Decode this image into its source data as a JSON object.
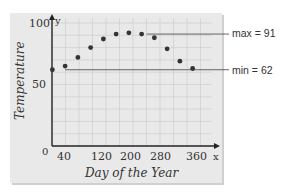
{
  "chart_data": {
    "type": "scatter",
    "title": "",
    "xlabel": "Day of the Year",
    "ylabel": "Temperature",
    "x_axis_letter": "x",
    "y_axis_letter": "y",
    "x_ticks": [
      "0",
      "40",
      "120",
      "200",
      "280",
      "360"
    ],
    "y_ticks": [
      "50",
      "100"
    ],
    "xlim": [
      0,
      380
    ],
    "ylim": [
      0,
      100
    ],
    "grid": true,
    "x": [
      15,
      45,
      75,
      105,
      135,
      165,
      195,
      225,
      255,
      285,
      315,
      345
    ],
    "values": [
      62,
      65,
      72,
      80,
      87,
      91,
      92,
      91,
      88,
      79,
      69,
      63
    ],
    "annotations": [
      {
        "label": "max = 91",
        "value": 91
      },
      {
        "label": "min = 62",
        "value": 62
      }
    ]
  }
}
